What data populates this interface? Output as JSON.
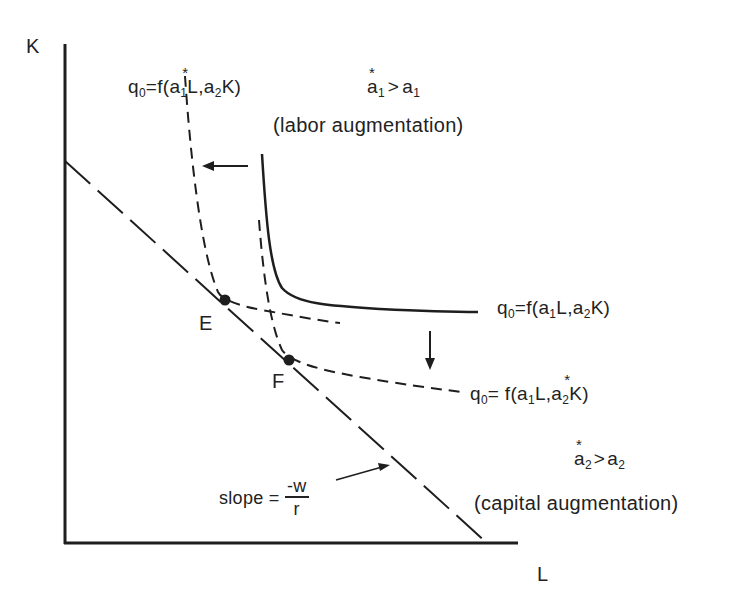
{
  "axes": {
    "y_label": "K",
    "x_label": "L"
  },
  "isoquants": {
    "original": {
      "label_prefix": "q",
      "label_sub": "0",
      "label_body": "=f(a",
      "label_rest_1": "1",
      "label_rest_2": "L,a",
      "label_rest_3": "2",
      "label_rest_4": "K)",
      "style": "solid"
    },
    "labor_augmented": {
      "label_prefix": "q",
      "label_sub": "0",
      "label_body": "=f(a",
      "label_rest_1": "1",
      "label_rest_2": "L,a",
      "label_rest_3": "2",
      "label_rest_4": "K)",
      "starred": "a1",
      "style": "dashed"
    },
    "capital_augmented": {
      "label_prefix": "q",
      "label_sub": "0",
      "label_body": "= f(a",
      "label_rest_1": "1",
      "label_rest_2": "L,a",
      "label_rest_3": "2",
      "label_rest_4": "K)",
      "starred": "a2",
      "style": "dashed"
    }
  },
  "annotations": {
    "labor_condition": {
      "a": "a",
      "sub1": "1",
      "op": ">",
      "b": "a",
      "sub2": "1"
    },
    "labor_text": "(labor augmentation)",
    "capital_condition": {
      "a": "a",
      "sub1": "2",
      "op": ">",
      "b": "a",
      "sub2": "2"
    },
    "capital_text": "(capital augmentation)",
    "slope_label": "slope =",
    "slope_num": "-w",
    "slope_den": "r"
  },
  "points": [
    {
      "name": "E",
      "x": 224,
      "y": 301
    },
    {
      "name": "F",
      "x": 289,
      "y": 360
    }
  ],
  "colors": {
    "ink": "#1e1e1e",
    "background": "#ffffff"
  }
}
